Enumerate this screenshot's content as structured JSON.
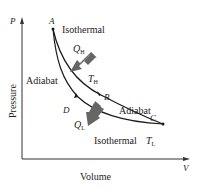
{
  "diagram": {
    "axes": {
      "x_symbol": "V",
      "y_symbol": "P",
      "x_label": "Volume",
      "y_label": "Pressure"
    },
    "points": {
      "A": "A",
      "B": "B",
      "C": "C",
      "D": "D"
    },
    "curves": {
      "isothermal_high": "Isothermal",
      "adiabat_left": "Adiabat",
      "adiabat_right": "Adiabat",
      "isothermal_low": "Isothermal"
    },
    "temperatures": {
      "high_main": "T",
      "high_sub": "H",
      "low_main": "T",
      "low_sub": "L"
    },
    "heat": {
      "in_main": "Q",
      "in_sub": "H",
      "out_main": "Q",
      "out_sub": "L"
    },
    "colors": {
      "line": "#1a1a1a",
      "axis": "#333333",
      "arrow": "#666666",
      "text": "#222222"
    }
  }
}
